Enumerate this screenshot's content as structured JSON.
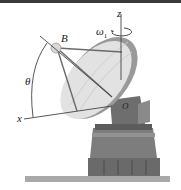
{
  "figure": {
    "labels": {
      "z_axis": "z",
      "x_axis": "x",
      "omega": "ω",
      "omega_sub": "1",
      "point_B": "B",
      "origin": "O",
      "angle": "θ"
    },
    "colors": {
      "top_bar": "#3a3a3a",
      "dish_light": "#e8e8e8",
      "dish_shadow": "#9a9a9a",
      "base": "#7d7d7d",
      "base_dark": "#5c5c5c",
      "ground": "#a9a9a9",
      "lines": "#555555"
    }
  }
}
